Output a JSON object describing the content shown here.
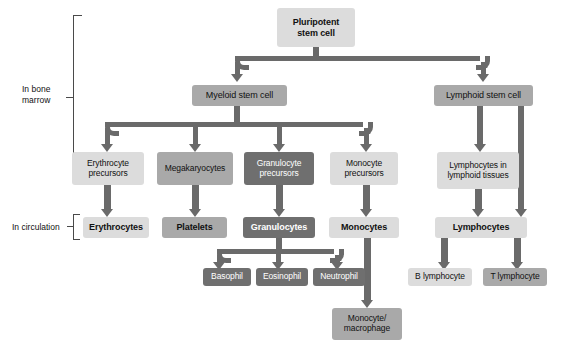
{
  "diagram": {
    "colors": {
      "light": "#dcdcdc",
      "medium": "#a9a9a9",
      "dark": "#6f6f6f",
      "connector": "#6a6a6a",
      "text_dark": "#111111",
      "text_light": "#ffffff",
      "background": "#ffffff"
    },
    "side_labels": [
      {
        "id": "in-bone-marrow",
        "line1": "In bone",
        "line2": "marrow"
      },
      {
        "id": "in-circulation",
        "line1": "In circulation",
        "line2": ""
      }
    ],
    "nodes": [
      {
        "id": "pluripotent-stem-cell",
        "line1": "Pluripotent",
        "line2": "stem cell",
        "shade": "light",
        "bold": true
      },
      {
        "id": "myeloid-stem-cell",
        "line1": "Myeloid stem cell",
        "line2": "",
        "shade": "medium",
        "bold": false
      },
      {
        "id": "lymphoid-stem-cell",
        "line1": "Lymphoid stem cell",
        "line2": "",
        "shade": "medium",
        "bold": false
      },
      {
        "id": "erythrocyte-precursors",
        "line1": "Erythrocyte",
        "line2": "precursors",
        "shade": "light",
        "bold": false
      },
      {
        "id": "megakaryocytes",
        "line1": "Megakaryocytes",
        "line2": "",
        "shade": "medium",
        "bold": false
      },
      {
        "id": "granulocyte-precursors",
        "line1": "Granulocyte",
        "line2": "precursors",
        "shade": "dark",
        "bold": false
      },
      {
        "id": "monocyte-precursors",
        "line1": "Monocyte",
        "line2": "precursors",
        "shade": "light",
        "bold": false
      },
      {
        "id": "lymphocytes-in-lymphoid-tissues",
        "line1": "Lymphocytes in",
        "line2": "lymphoid tissues",
        "shade": "light",
        "bold": false
      },
      {
        "id": "erythrocytes",
        "line1": "Erythrocytes",
        "line2": "",
        "shade": "light",
        "bold": true
      },
      {
        "id": "platelets",
        "line1": "Platelets",
        "line2": "",
        "shade": "medium",
        "bold": true
      },
      {
        "id": "granulocytes",
        "line1": "Granulocytes",
        "line2": "",
        "shade": "dark",
        "bold": true
      },
      {
        "id": "monocytes",
        "line1": "Monocytes",
        "line2": "",
        "shade": "light",
        "bold": true
      },
      {
        "id": "lymphocytes",
        "line1": "Lymphocytes",
        "line2": "",
        "shade": "light",
        "bold": true
      },
      {
        "id": "basophil",
        "line1": "Basophil",
        "line2": "",
        "shade": "dark",
        "bold": false
      },
      {
        "id": "eosinophil",
        "line1": "Eosinophil",
        "line2": "",
        "shade": "dark",
        "bold": false
      },
      {
        "id": "neutrophil",
        "line1": "Neutrophil",
        "line2": "",
        "shade": "dark",
        "bold": false
      },
      {
        "id": "b-lymphocyte",
        "line1": "B lymphocyte",
        "line2": "",
        "shade": "light",
        "bold": false
      },
      {
        "id": "t-lymphocyte",
        "line1": "T lymphocyte",
        "line2": "",
        "shade": "medium",
        "bold": false
      },
      {
        "id": "monocyte-macrophage",
        "line1": "Monocyte/",
        "line2": "macrophage",
        "shade": "medium",
        "bold": false
      }
    ],
    "edges": [
      {
        "from": "pluripotent-stem-cell",
        "to": "myeloid-stem-cell"
      },
      {
        "from": "pluripotent-stem-cell",
        "to": "lymphoid-stem-cell"
      },
      {
        "from": "myeloid-stem-cell",
        "to": "erythrocyte-precursors"
      },
      {
        "from": "myeloid-stem-cell",
        "to": "megakaryocytes"
      },
      {
        "from": "myeloid-stem-cell",
        "to": "granulocyte-precursors"
      },
      {
        "from": "myeloid-stem-cell",
        "to": "monocyte-precursors"
      },
      {
        "from": "lymphoid-stem-cell",
        "to": "lymphocytes-in-lymphoid-tissues"
      },
      {
        "from": "lymphoid-stem-cell",
        "to": "lymphocytes"
      },
      {
        "from": "erythrocyte-precursors",
        "to": "erythrocytes"
      },
      {
        "from": "megakaryocytes",
        "to": "platelets"
      },
      {
        "from": "granulocyte-precursors",
        "to": "granulocytes"
      },
      {
        "from": "monocyte-precursors",
        "to": "monocytes"
      },
      {
        "from": "lymphocytes-in-lymphoid-tissues",
        "to": "lymphocytes"
      },
      {
        "from": "granulocytes",
        "to": "basophil"
      },
      {
        "from": "granulocytes",
        "to": "eosinophil"
      },
      {
        "from": "granulocytes",
        "to": "neutrophil"
      },
      {
        "from": "monocytes",
        "to": "monocyte-macrophage"
      },
      {
        "from": "lymphocytes",
        "to": "b-lymphocyte"
      },
      {
        "from": "lymphocytes",
        "to": "t-lymphocyte"
      }
    ]
  }
}
